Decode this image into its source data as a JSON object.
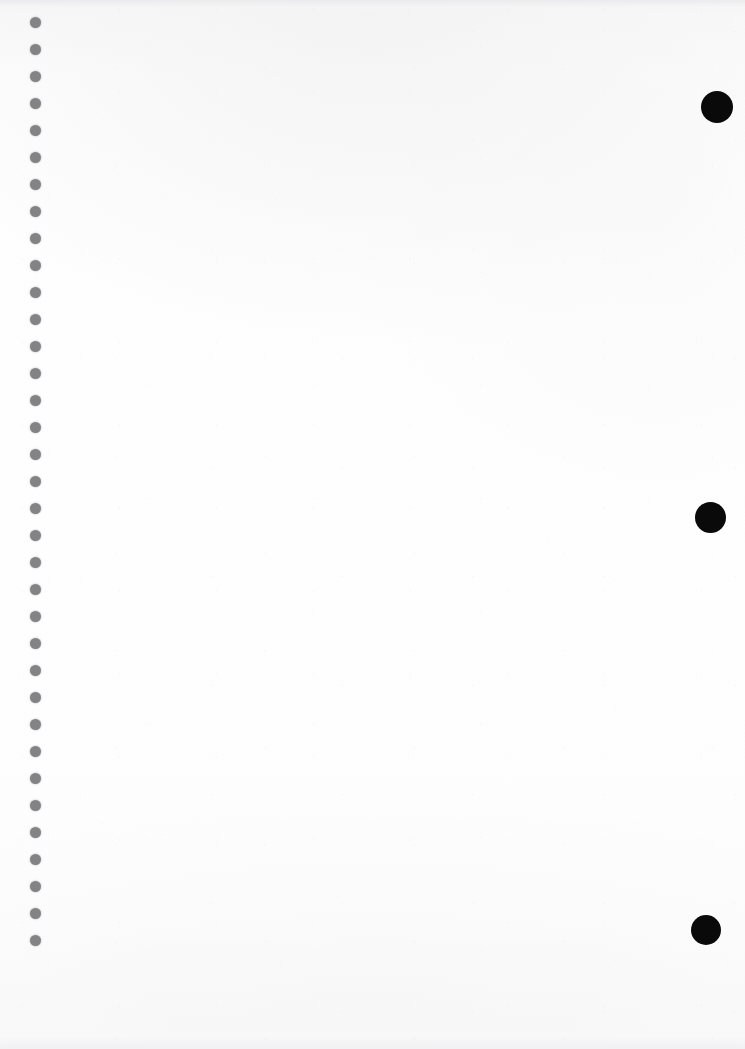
{
  "document": {
    "kind": "scanned-page",
    "title": "Blank scanned notebook page",
    "page_width": 745,
    "page_height": 1049,
    "content_text": "",
    "paper_color": "#fdfdfd",
    "paper_top_edge_color": "#eaeaec",
    "is_blank": true
  },
  "binding": {
    "name": "spiral-binding-punch-holes",
    "side": "left",
    "hole_color": "#838386",
    "hole_count": 35,
    "hole_diameter": 11,
    "center_x": 35,
    "first_center_y": 22,
    "spacing": 27.1,
    "holes": [
      {
        "cx": 35,
        "cy": 22,
        "d": 11
      },
      {
        "cx": 35,
        "cy": 49,
        "d": 11
      },
      {
        "cx": 35,
        "cy": 76,
        "d": 11
      },
      {
        "cx": 35,
        "cy": 103,
        "d": 11
      },
      {
        "cx": 35,
        "cy": 130,
        "d": 11
      },
      {
        "cx": 35,
        "cy": 157,
        "d": 11
      },
      {
        "cx": 35,
        "cy": 184,
        "d": 11
      },
      {
        "cx": 35,
        "cy": 211,
        "d": 11
      },
      {
        "cx": 35,
        "cy": 238,
        "d": 11
      },
      {
        "cx": 35,
        "cy": 265,
        "d": 11
      },
      {
        "cx": 35,
        "cy": 292,
        "d": 11
      },
      {
        "cx": 35,
        "cy": 319,
        "d": 11
      },
      {
        "cx": 35,
        "cy": 346,
        "d": 11
      },
      {
        "cx": 35,
        "cy": 373,
        "d": 11
      },
      {
        "cx": 35,
        "cy": 400,
        "d": 11
      },
      {
        "cx": 35,
        "cy": 427,
        "d": 11
      },
      {
        "cx": 35,
        "cy": 454,
        "d": 11
      },
      {
        "cx": 35,
        "cy": 481,
        "d": 11
      },
      {
        "cx": 35,
        "cy": 508,
        "d": 11
      },
      {
        "cx": 35,
        "cy": 535,
        "d": 11
      },
      {
        "cx": 35,
        "cy": 562,
        "d": 11
      },
      {
        "cx": 35,
        "cy": 589,
        "d": 11
      },
      {
        "cx": 35,
        "cy": 616,
        "d": 11
      },
      {
        "cx": 35,
        "cy": 643,
        "d": 11
      },
      {
        "cx": 35,
        "cy": 670,
        "d": 11
      },
      {
        "cx": 35,
        "cy": 697,
        "d": 11
      },
      {
        "cx": 35,
        "cy": 724,
        "d": 11
      },
      {
        "cx": 35,
        "cy": 751,
        "d": 11
      },
      {
        "cx": 35,
        "cy": 778,
        "d": 11
      },
      {
        "cx": 35,
        "cy": 805,
        "d": 11
      },
      {
        "cx": 35,
        "cy": 832,
        "d": 11
      },
      {
        "cx": 35,
        "cy": 859,
        "d": 11
      },
      {
        "cx": 35,
        "cy": 886,
        "d": 11
      },
      {
        "cx": 35,
        "cy": 913,
        "d": 11
      },
      {
        "cx": 35,
        "cy": 940,
        "d": 11
      }
    ]
  },
  "fiducials": {
    "name": "registration-marks",
    "side": "right",
    "color": "#0a0a0a",
    "count": 3,
    "marks": [
      {
        "cx": 717,
        "cy": 107,
        "d": 32
      },
      {
        "cx": 710,
        "cy": 517,
        "d": 31
      },
      {
        "cx": 706,
        "cy": 930,
        "d": 30
      }
    ]
  }
}
